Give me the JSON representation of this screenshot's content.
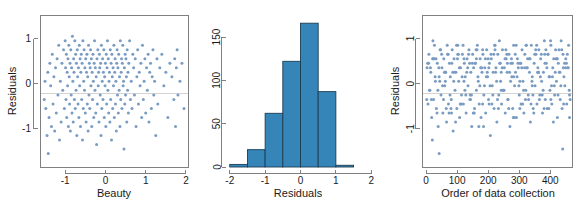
{
  "figure": {
    "background_color": "#ffffff",
    "point_color": "#7a9cc2",
    "bar_fill_color": "#3685b8",
    "bar_edge_color": "#1b3d52",
    "axis_color": "#808080",
    "reference_line_color": "#c8c8c8",
    "panel_count": 3
  },
  "panels": {
    "left": {
      "name": "residuals-vs-beauty",
      "ylabel": "Residuals",
      "xlabel": "Beauty",
      "xticks": [
        "-1",
        "0",
        "1",
        "2"
      ],
      "yticks": [
        "-1",
        "0",
        "1"
      ]
    },
    "middle": {
      "name": "histogram-of-residuals",
      "ylabel": "",
      "xlabel": "Residuals",
      "xticks": [
        "-2",
        "-1",
        "0",
        "1",
        "2"
      ],
      "yticks": [
        "0",
        "50",
        "100",
        "150"
      ]
    },
    "right": {
      "name": "residuals-vs-order",
      "ylabel": "Residuals",
      "xlabel": "Order of data collection",
      "xticks": [
        "0",
        "100",
        "200",
        "300",
        "400"
      ],
      "yticks": [
        "-1",
        "0",
        "1"
      ]
    }
  },
  "chart_data": [
    {
      "type": "scatter",
      "name": "residuals-vs-beauty",
      "title": "",
      "xlabel": "Beauty",
      "ylabel": "Residuals",
      "xlim": [
        -1.6,
        2.05
      ],
      "ylim": [
        -1.85,
        1.5
      ],
      "xticks": [
        -1,
        0,
        1,
        2
      ],
      "yticks": [
        -1,
        0,
        1
      ],
      "grid": false,
      "reference_line_y": 0,
      "n_points": 330,
      "x": [
        -1.52,
        -1.5,
        -1.48,
        -1.45,
        -1.43,
        -1.42,
        -1.4,
        -1.38,
        -1.36,
        -1.34,
        -1.32,
        -1.3,
        -1.28,
        -1.26,
        -1.24,
        -1.22,
        -1.2,
        -1.18,
        -1.16,
        -1.14,
        -1.12,
        -1.1,
        -1.08,
        -1.06,
        -1.04,
        -1.02,
        -1.0,
        -0.99,
        -0.98,
        -0.97,
        -0.96,
        -0.95,
        -0.94,
        -0.93,
        -0.92,
        -0.91,
        -0.9,
        -0.89,
        -0.88,
        -0.87,
        -0.86,
        -0.85,
        -0.84,
        -0.83,
        -0.82,
        -0.81,
        -0.8,
        -0.79,
        -0.78,
        -0.77,
        -0.76,
        -0.75,
        -0.74,
        -0.73,
        -0.72,
        -0.71,
        -0.7,
        -0.69,
        -0.68,
        -0.67,
        -0.66,
        -0.65,
        -0.64,
        -0.63,
        -0.62,
        -0.61,
        -0.6,
        -0.59,
        -0.58,
        -0.57,
        -0.56,
        -0.55,
        -0.54,
        -0.53,
        -0.52,
        -0.51,
        -0.5,
        -0.49,
        -0.48,
        -0.47,
        -0.46,
        -0.45,
        -0.44,
        -0.43,
        -0.42,
        -0.41,
        -0.4,
        -0.39,
        -0.38,
        -0.37,
        -0.36,
        -0.35,
        -0.34,
        -0.33,
        -0.32,
        -0.31,
        -0.3,
        -0.29,
        -0.28,
        -0.27,
        -0.26,
        -0.25,
        -0.24,
        -0.23,
        -0.22,
        -0.21,
        -0.2,
        -0.19,
        -0.18,
        -0.17,
        -0.16,
        -0.15,
        -0.14,
        -0.13,
        -0.12,
        -0.11,
        -0.1,
        -0.09,
        -0.08,
        -0.07,
        -0.06,
        -0.05,
        -0.04,
        -0.03,
        -0.02,
        -0.01,
        0.0,
        0.01,
        0.02,
        0.03,
        0.04,
        0.05,
        0.06,
        0.07,
        0.08,
        0.09,
        0.1,
        0.11,
        0.12,
        0.13,
        0.14,
        0.15,
        0.16,
        0.17,
        0.18,
        0.19,
        0.2,
        0.21,
        0.22,
        0.23,
        0.24,
        0.25,
        0.26,
        0.27,
        0.28,
        0.29,
        0.3,
        0.31,
        0.32,
        0.33,
        0.34,
        0.35,
        0.36,
        0.37,
        0.38,
        0.39,
        0.4,
        0.41,
        0.42,
        0.43,
        0.44,
        0.45,
        0.46,
        0.47,
        0.48,
        0.49,
        0.5,
        0.51,
        0.52,
        0.53,
        0.54,
        0.55,
        0.56,
        0.57,
        0.58,
        0.6,
        0.62,
        0.64,
        0.66,
        0.68,
        0.7,
        0.72,
        0.74,
        0.76,
        0.78,
        0.8,
        0.82,
        0.84,
        0.86,
        0.88,
        0.9,
        0.92,
        0.94,
        0.96,
        0.98,
        1.0,
        1.02,
        1.04,
        1.06,
        1.08,
        1.1,
        1.12,
        1.14,
        1.16,
        1.18,
        1.2,
        1.22,
        1.25,
        1.28,
        1.3,
        1.35,
        1.4,
        1.45,
        1.5,
        1.55,
        1.6,
        1.65,
        1.7,
        1.72,
        1.74,
        1.76,
        1.78,
        1.8,
        1.85,
        1.9,
        1.95
      ],
      "y": [
        -0.35,
        0.05,
        -0.55,
        -1.15,
        0.25,
        -1.55,
        -0.75,
        0.45,
        -0.05,
        -0.95,
        0.65,
        -0.45,
        0.15,
        -1.05,
        0.35,
        -0.65,
        0.55,
        -0.25,
        0.85,
        -1.25,
        0.05,
        -0.85,
        0.45,
        -0.15,
        0.75,
        -0.55,
        0.95,
        0.35,
        -0.35,
        0.65,
        -0.75,
        0.25,
        -0.05,
        0.55,
        -0.95,
        0.85,
        0.15,
        -0.45,
        0.45,
        -1.05,
        0.75,
        -0.25,
        0.35,
        -0.65,
        1.05,
        0.05,
        -0.85,
        0.55,
        0.25,
        -0.35,
        0.95,
        -0.55,
        0.65,
        -0.15,
        0.45,
        -1.15,
        0.75,
        0.15,
        -0.45,
        0.35,
        -0.75,
        0.85,
        -0.05,
        0.55,
        -0.95,
        0.25,
        0.65,
        -0.35,
        0.45,
        -1.25,
        0.95,
        -0.55,
        0.05,
        0.75,
        -0.15,
        0.35,
        -0.65,
        0.55,
        -0.85,
        0.25,
        0.65,
        -0.45,
        0.15,
        -1.05,
        0.85,
        -0.25,
        0.45,
        -0.55,
        0.35,
        0.75,
        -0.05,
        0.55,
        -0.95,
        0.25,
        -0.35,
        0.65,
        0.05,
        -0.75,
        0.45,
        0.95,
        -0.15,
        0.35,
        -0.65,
        0.15,
        -1.35,
        0.55,
        -0.45,
        0.75,
        -0.05,
        0.25,
        -0.85,
        0.65,
        0.35,
        -0.25,
        0.45,
        -1.15,
        0.85,
        -0.55,
        0.05,
        0.55,
        -0.35,
        0.25,
        0.75,
        -0.75,
        0.15,
        -0.05,
        0.45,
        -0.95,
        0.65,
        -0.45,
        0.35,
        0.95,
        -0.15,
        0.55,
        -0.65,
        0.05,
        0.25,
        -0.85,
        0.75,
        -0.35,
        0.45,
        -1.25,
        0.65,
        0.15,
        -0.55,
        0.35,
        -0.05,
        0.85,
        -0.75,
        0.25,
        0.55,
        -0.45,
        0.05,
        -1.05,
        0.45,
        0.75,
        -0.25,
        0.35,
        -0.65,
        0.65,
        -0.15,
        0.15,
        -0.95,
        0.95,
        -0.35,
        0.25,
        0.55,
        -0.55,
        0.45,
        0.85,
        -0.05,
        0.05,
        -1.45,
        0.35,
        -0.45,
        0.65,
        -0.25,
        0.55,
        0.15,
        -0.85,
        0.75,
        -0.15,
        0.25,
        -0.65,
        0.45,
        0.95,
        -0.35,
        0.05,
        -0.55,
        0.65,
        0.35,
        -0.25,
        0.55,
        -0.95,
        0.15,
        0.75,
        -0.45,
        0.25,
        -0.05,
        0.45,
        -0.75,
        0.85,
        -0.35,
        0.05,
        0.55,
        -0.65,
        0.35,
        -0.15,
        0.65,
        -0.85,
        0.25,
        0.45,
        -0.55,
        0.15,
        0.75,
        -0.25,
        0.05,
        -1.15,
        0.55,
        -0.45,
        0.35,
        0.65,
        -0.05,
        0.25,
        -0.75,
        0.45,
        0.15,
        -0.35,
        0.55,
        -0.95,
        0.35,
        0.75,
        -0.25,
        0.05,
        0.45,
        -0.55,
        0.25,
        0.65,
        -0.15,
        0.35,
        -0.65,
        0.55,
        0.15,
        -0.45,
        0.45,
        0.25,
        -0.35,
        0.55,
        0.05,
        -0.55,
        0.35,
        0.65,
        -0.25
      ]
    },
    {
      "type": "bar",
      "name": "histogram-of-residuals",
      "title": "",
      "xlabel": "Residuals",
      "ylabel": "",
      "xlim": [
        -2.05,
        2.05
      ],
      "ylim": [
        0,
        172
      ],
      "xticks": [
        -2,
        -1,
        0,
        1,
        2
      ],
      "yticks": [
        0,
        50,
        100,
        150
      ],
      "grid": false,
      "bin_width": 0.5,
      "bin_edges": [
        -2.0,
        -1.5,
        -1.0,
        -0.5,
        0.0,
        0.5,
        1.0,
        1.5
      ],
      "categories": [
        "[-2.0,-1.5)",
        "[-1.5,-1.0)",
        "[-1.0,-0.5)",
        "[-0.5,0.0)",
        "[0.0,0.5)",
        "[0.5,1.0)",
        "[1.0,1.5)"
      ],
      "values": [
        3,
        20,
        62,
        122,
        166,
        87,
        2
      ]
    },
    {
      "type": "scatter",
      "name": "residuals-vs-order",
      "title": "",
      "xlabel": "Order of data collection",
      "ylabel": "Residuals",
      "xlim": [
        -10,
        470
      ],
      "ylim": [
        -1.85,
        1.5
      ],
      "xticks": [
        0,
        100,
        200,
        300,
        400
      ],
      "yticks": [
        -1,
        0,
        1
      ],
      "grid": false,
      "reference_line_y": 0,
      "n_points": 340,
      "x": [
        3,
        6,
        9,
        12,
        15,
        18,
        21,
        24,
        27,
        30,
        33,
        36,
        39,
        42,
        45,
        48,
        51,
        54,
        57,
        60,
        63,
        66,
        69,
        72,
        75,
        78,
        81,
        84,
        87,
        90,
        93,
        96,
        99,
        102,
        105,
        108,
        111,
        114,
        117,
        120,
        123,
        126,
        129,
        132,
        135,
        138,
        141,
        144,
        147,
        150,
        153,
        156,
        159,
        162,
        165,
        168,
        171,
        174,
        177,
        180,
        183,
        186,
        189,
        192,
        195,
        198,
        201,
        204,
        207,
        210,
        213,
        216,
        219,
        222,
        225,
        228,
        231,
        234,
        237,
        240,
        243,
        246,
        249,
        252,
        255,
        258,
        261,
        264,
        267,
        270,
        273,
        276,
        279,
        282,
        285,
        288,
        291,
        294,
        297,
        300,
        303,
        306,
        309,
        312,
        315,
        318,
        321,
        324,
        327,
        330,
        333,
        336,
        339,
        342,
        345,
        348,
        351,
        354,
        357,
        360,
        363,
        366,
        369,
        372,
        375,
        378,
        381,
        384,
        387,
        390,
        393,
        396,
        399,
        402,
        405,
        408,
        411,
        414,
        417,
        420,
        423,
        426,
        429,
        432,
        435,
        438,
        441,
        444,
        447,
        450,
        453,
        456,
        459,
        462,
        5,
        11,
        17,
        23,
        29,
        35,
        41,
        47,
        53,
        59,
        65,
        71,
        77,
        83,
        89,
        95,
        101,
        107,
        113,
        119,
        125,
        131,
        137,
        143,
        149,
        155,
        161,
        167,
        173,
        179,
        185,
        191,
        197,
        203,
        209,
        215,
        221,
        227,
        233,
        239,
        245,
        251,
        257,
        263,
        269,
        275,
        281,
        287,
        293,
        299,
        305,
        311,
        317,
        323,
        329,
        335,
        341,
        347,
        353,
        359,
        365,
        371,
        377,
        383,
        389,
        395,
        401,
        407,
        413,
        419,
        425,
        431,
        437,
        443,
        449,
        455,
        461,
        8,
        20,
        32,
        44,
        56,
        68,
        80,
        92,
        104,
        116,
        128,
        140,
        152,
        164,
        176,
        188,
        200,
        212,
        224,
        236,
        248,
        260,
        272,
        284,
        296,
        308,
        320,
        332,
        344,
        356,
        368,
        380,
        392,
        404,
        416,
        428,
        440,
        452,
        464,
        14,
        26,
        38,
        50,
        62,
        74,
        86,
        98,
        110,
        122,
        134,
        146,
        158,
        170,
        182,
        194,
        206,
        218,
        230,
        242,
        254,
        266,
        278,
        290,
        302,
        314,
        326,
        338,
        350,
        362,
        374,
        386,
        398,
        410,
        422,
        434,
        446,
        458,
        2,
        22,
        42,
        62,
        82,
        102,
        122,
        142,
        162,
        182,
        202,
        222,
        242,
        262,
        282,
        302,
        322,
        342,
        362,
        382,
        402,
        422,
        442,
        462
      ],
      "y": [
        0.35,
        -0.45,
        0.65,
        -0.15,
        0.25,
        -0.75,
        0.55,
        -0.35,
        0.85,
        0.05,
        -0.55,
        0.45,
        -0.95,
        0.15,
        0.75,
        -0.25,
        0.35,
        -0.65,
        0.55,
        -0.05,
        0.25,
        -0.85,
        0.65,
        -0.45,
        0.45,
        0.15,
        -0.35,
        0.75,
        -1.05,
        0.55,
        -0.15,
        0.25,
        -0.55,
        0.85,
        0.05,
        -0.75,
        0.35,
        -0.25,
        0.65,
        -0.45,
        0.45,
        0.15,
        -0.65,
        0.55,
        -0.05,
        0.75,
        -0.35,
        0.25,
        -0.95,
        0.65,
        0.35,
        -0.55,
        0.45,
        -0.15,
        0.85,
        0.05,
        -0.45,
        0.55,
        -0.75,
        0.25,
        0.65,
        -0.25,
        0.35,
        -0.65,
        0.75,
        0.15,
        -0.35,
        0.45,
        -1.15,
        0.55,
        -0.05,
        0.25,
        -0.55,
        0.85,
        0.35,
        -0.85,
        0.65,
        -0.25,
        0.45,
        0.05,
        -0.45,
        0.75,
        -0.15,
        0.35,
        -0.65,
        0.55,
        0.25,
        -0.35,
        0.65,
        -0.95,
        0.45,
        0.15,
        -0.55,
        0.85,
        -0.05,
        0.25,
        -0.75,
        0.55,
        0.35,
        -0.25,
        0.45,
        -0.45,
        0.75,
        0.05,
        -0.65,
        0.65,
        -0.15,
        0.35,
        0.55,
        -0.35,
        0.25,
        -0.85,
        0.85,
        0.15,
        -0.55,
        0.45,
        -0.05,
        0.65,
        -0.45,
        0.35,
        0.75,
        -0.25,
        0.55,
        0.05,
        -0.65,
        0.25,
        0.95,
        -0.35,
        0.45,
        -0.55,
        0.65,
        0.15,
        -0.15,
        0.85,
        -0.45,
        0.35,
        0.55,
        -0.25,
        0.75,
        0.05,
        -0.75,
        0.45,
        0.25,
        -0.35,
        0.95,
        -0.55,
        0.65,
        0.15,
        -0.05,
        0.55,
        -0.45,
        0.35,
        0.85,
        -0.25,
        0.45,
        -0.15,
        -0.35,
        0.55,
        0.15,
        -0.65,
        0.35,
        0.75,
        -0.05,
        0.25,
        -0.55,
        0.65,
        -0.25,
        0.45,
        0.05,
        -0.85,
        0.55,
        0.35,
        -0.45,
        0.85,
        -0.15,
        0.25,
        0.65,
        -0.35,
        0.45,
        -0.65,
        0.75,
        0.15,
        -0.05,
        0.35,
        -0.95,
        0.55,
        0.25,
        -0.45,
        0.65,
        -0.25,
        0.85,
        0.05,
        -0.55,
        0.45,
        0.35,
        -0.15,
        0.75,
        -0.35,
        0.25,
        0.55,
        -0.75,
        0.65,
        0.15,
        -0.05,
        0.45,
        -0.45,
        0.35,
        0.85,
        -0.25,
        0.55,
        0.05,
        -0.65,
        0.75,
        0.25,
        -0.35,
        0.65,
        -0.15,
        0.45,
        0.35,
        -0.55,
        0.95,
        0.15,
        -0.05,
        0.55,
        -0.25,
        0.25,
        0.75,
        -0.45,
        0.35,
        0.65,
        -0.15,
        0.45,
        -1.25,
        0.55,
        0.05,
        -0.35,
        0.85,
        -0.55,
        0.25,
        0.65,
        0.15,
        -0.25,
        0.45,
        -0.65,
        0.75,
        0.35,
        -0.05,
        0.55,
        -0.45,
        0.25,
        0.95,
        -0.15,
        0.65,
        0.05,
        -0.75,
        0.45,
        0.35,
        -0.35,
        0.55,
        -0.25,
        0.85,
        0.15,
        -0.55,
        0.65,
        -0.05,
        0.25,
        0.75,
        -1.45,
        0.45,
        -0.35,
        0.35,
        0.55,
        -0.15,
        0.65,
        0.05,
        -0.65,
        0.25,
        0.85,
        -0.45,
        0.55,
        0.35,
        -0.25,
        0.45,
        -0.95,
        0.75,
        0.15,
        -0.05,
        0.65,
        -0.35,
        0.25,
        0.55,
        -0.55,
        0.45,
        0.85,
        0.05,
        -0.15,
        0.35,
        -0.45,
        0.65,
        0.25,
        -0.25,
        0.75,
        0.15,
        -0.85,
        0.55,
        -0.05,
        0.45,
        0.35,
        -0.35,
        0.95,
        -1.55,
        0.25,
        -0.65,
        0.65,
        0.05,
        -0.25,
        0.55,
        -0.45,
        0.35,
        0.75,
        -0.15,
        0.45,
        0.15,
        -0.55,
        0.85,
        -0.05,
        0.25,
        0.65,
        -0.35,
        0.55,
        0.35,
        -0.75,
        0.45
      ]
    }
  ]
}
